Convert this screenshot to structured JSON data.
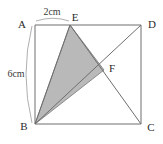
{
  "figure": {
    "background_color": "#ffffff",
    "stroke_color": "#6e6e6e",
    "label_color": "#2b2b2b",
    "shade_color": "#b9b9b9",
    "shade_stroke_color": "#777777"
  },
  "vertices": {
    "A": {
      "label": "A",
      "x": 35,
      "y": 25
    },
    "D": {
      "label": "D",
      "x": 141,
      "y": 25
    },
    "B": {
      "label": "B",
      "x": 35,
      "y": 124
    },
    "C": {
      "label": "C",
      "x": 141,
      "y": 124
    },
    "E": {
      "label": "E",
      "x": 70,
      "y": 25
    },
    "F": {
      "label": "F",
      "x": 104,
      "y": 70
    }
  },
  "dimensions": {
    "top_segment": {
      "label": "2cm",
      "from": "A",
      "to": "E",
      "value": 2,
      "unit": "cm"
    },
    "left_side": {
      "label": "6cm",
      "from": "A",
      "to": "B",
      "value": 6,
      "unit": "cm"
    }
  },
  "shaded_region": {
    "name": "triangle-BEF",
    "points": "B,E,F"
  },
  "segments": [
    {
      "name": "side-AD",
      "from": "A",
      "to": "D"
    },
    {
      "name": "side-DC",
      "from": "D",
      "to": "C"
    },
    {
      "name": "side-CB",
      "from": "C",
      "to": "B"
    },
    {
      "name": "side-BA",
      "from": "B",
      "to": "A"
    },
    {
      "name": "diagonal-BD",
      "from": "B",
      "to": "D"
    },
    {
      "name": "line-EC",
      "from": "E",
      "to": "C"
    },
    {
      "name": "line-BE",
      "from": "B",
      "to": "E"
    }
  ]
}
